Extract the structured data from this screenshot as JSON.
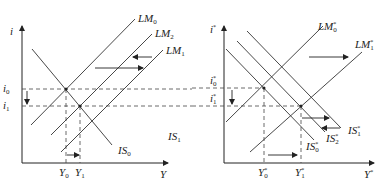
{
  "left_panel": {
    "y_axis_label": "i",
    "x_axis_label": "Y",
    "levels": [
      {
        "name": "i0",
        "base": "i",
        "sub": "0"
      },
      {
        "name": "i1",
        "base": "i",
        "sub": "1"
      }
    ],
    "outputs": [
      {
        "name": "Y0",
        "base": "Y",
        "sub": "0"
      },
      {
        "name": "Y1",
        "base": "Y",
        "sub": "1"
      }
    ],
    "curves": [
      {
        "name": "LM0",
        "base": "LM",
        "sub": "0"
      },
      {
        "name": "LM2",
        "base": "LM",
        "sub": "2"
      },
      {
        "name": "LM1",
        "base": "LM",
        "sub": "1"
      },
      {
        "name": "IS0",
        "base": "IS",
        "sub": "0"
      },
      {
        "name": "IS1",
        "base": "IS",
        "sub": "1"
      }
    ]
  },
  "right_panel": {
    "y_axis_label": "i",
    "y_axis_sup": "*",
    "x_axis_label": "Y",
    "x_axis_sup": "*",
    "levels": [
      {
        "name": "i0*",
        "base": "i",
        "sub": "0",
        "sup": "*"
      },
      {
        "name": "i1*",
        "base": "i",
        "sub": "1",
        "sup": "*"
      }
    ],
    "outputs": [
      {
        "name": "Y0*",
        "base": "Y",
        "sub": "0",
        "sup": "*"
      },
      {
        "name": "Y1*",
        "base": "Y",
        "sub": "1",
        "sup": "*"
      }
    ],
    "curves": [
      {
        "name": "LM0*",
        "base": "LM",
        "sub": "0",
        "sup": "*"
      },
      {
        "name": "LM1*",
        "base": "LM",
        "sub": "1",
        "sup": "*"
      },
      {
        "name": "IS0*",
        "base": "IS",
        "sub": "0",
        "sup": "*"
      },
      {
        "name": "IS2*",
        "base": "IS",
        "sub": "2",
        "sup": "*"
      },
      {
        "name": "IS1*",
        "base": "IS",
        "sub": "1",
        "sup": "*"
      }
    ]
  },
  "colors": {
    "line": "#333333",
    "background": "#ffffff"
  }
}
